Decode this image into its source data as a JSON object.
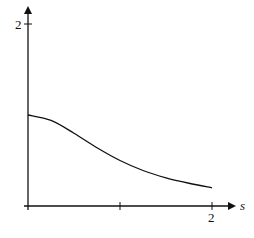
{
  "chart_data": {
    "type": "line",
    "title": "",
    "xlabel": "s",
    "ylabel": "",
    "xlim": [
      0,
      2.2
    ],
    "ylim": [
      0,
      2.1
    ],
    "grid": false,
    "x_ticks": [
      0,
      1,
      2
    ],
    "x_tick_labels": [
      "",
      "",
      "2"
    ],
    "y_ticks": [
      0,
      2
    ],
    "y_tick_labels": [
      "",
      "2"
    ],
    "series": [
      {
        "name": "f(s)",
        "x": [
          0,
          0.25,
          0.5,
          0.75,
          1.0,
          1.25,
          1.5,
          1.75,
          2.0
        ],
        "values": [
          1.0,
          0.94,
          0.8,
          0.64,
          0.5,
          0.39,
          0.31,
          0.25,
          0.2
        ]
      }
    ]
  },
  "axes": {
    "x_label": "s",
    "x_tick_2": "2",
    "y_tick_2": "2"
  }
}
